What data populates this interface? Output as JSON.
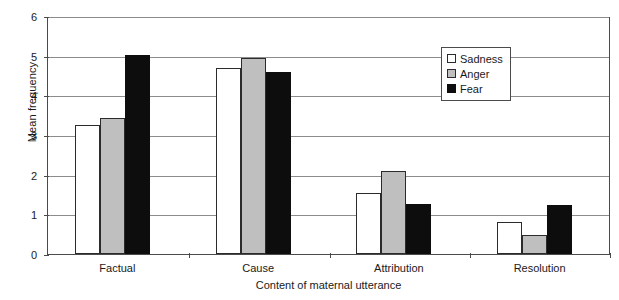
{
  "chart_data": {
    "type": "bar",
    "title": "",
    "subtitle": "",
    "xlabel": "Content of maternal utterance",
    "ylabel": "Mean frequency",
    "categories": [
      "Factual",
      "Cause",
      "Attribution",
      "Resolution"
    ],
    "series": [
      {
        "name": "Sadness",
        "color": "#ffffff",
        "values": [
          3.25,
          4.68,
          1.55,
          0.8
        ]
      },
      {
        "name": "Anger",
        "color": "#bfbfbf",
        "values": [
          3.42,
          4.93,
          2.1,
          0.47
        ]
      },
      {
        "name": "Fear",
        "color": "#0d0d0d",
        "values": [
          5.02,
          4.6,
          1.27,
          1.23
        ]
      }
    ],
    "ylim": [
      0,
      6
    ],
    "yticks": [
      0,
      1,
      2,
      3,
      4,
      5,
      6
    ],
    "ytick_labels": [
      "0",
      "1",
      "2",
      "3",
      "4",
      "5",
      "6"
    ],
    "grid": true,
    "grid_axis": "y",
    "legend_position": "upper right",
    "legend_entries": [
      "Sadness",
      "Anger",
      "Fear"
    ]
  },
  "legend": {
    "items": [
      {
        "label": "Sadness"
      },
      {
        "label": "Anger"
      },
      {
        "label": "Fear"
      }
    ]
  },
  "axes": {
    "y_title": "Mean frequency",
    "x_title": "Content of maternal utterance"
  }
}
